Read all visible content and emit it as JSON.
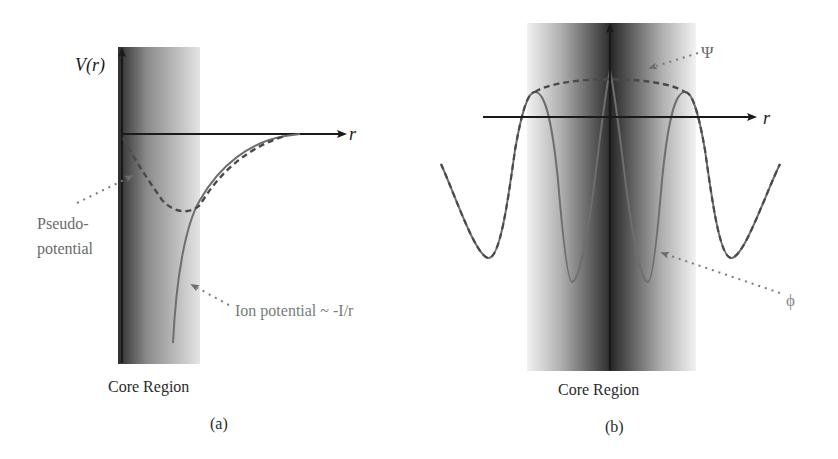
{
  "panel_a": {
    "y_axis_label": "V(r)",
    "x_axis_label": "r",
    "pseudo_label_line1": "Pseudo-",
    "pseudo_label_line2": "potential",
    "ion_label": "Ion potential ~ -I/r",
    "region_label": "Core Region",
    "caption": "(a)"
  },
  "panel_b": {
    "x_axis_label": "r",
    "psi_label": "Ψ",
    "phi_label": "ϕ",
    "region_label": "Core Region",
    "caption": "(b)"
  },
  "colors": {
    "axis": "#1a1a1a",
    "curve": "#6e6e6e",
    "dashed": "#4a4a4a",
    "label": "#7a7a7a",
    "core_dark": "#3a3a3a",
    "core_light": "#e8e8e8"
  }
}
